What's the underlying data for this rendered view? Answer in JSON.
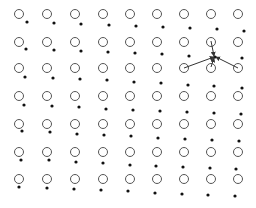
{
  "diagram": {
    "colors": {
      "circle_stroke": "#555555",
      "dot_fill": "#111111",
      "arrow": "#333333",
      "background": "#ffffff"
    },
    "circle_radius": 4.5,
    "dot_radius": 1.6,
    "grid": {
      "cols_x": [
        19,
        47,
        75,
        103,
        130,
        157,
        184,
        211,
        238
      ],
      "rows_y": [
        14,
        42,
        68,
        96,
        124,
        152,
        179
      ]
    },
    "dots": [
      [
        27,
        22
      ],
      [
        54,
        23
      ],
      [
        81,
        24
      ],
      [
        109,
        25
      ],
      [
        136,
        26
      ],
      [
        163,
        27
      ],
      [
        190,
        28
      ],
      [
        217,
        29
      ],
      [
        244,
        31
      ],
      [
        26,
        49
      ],
      [
        54,
        50
      ],
      [
        81,
        51
      ],
      [
        108,
        52
      ],
      [
        135,
        53
      ],
      [
        162,
        54
      ],
      [
        189,
        56
      ],
      [
        215,
        57
      ],
      [
        242,
        58
      ],
      [
        25,
        77
      ],
      [
        53,
        78
      ],
      [
        80,
        79
      ],
      [
        107,
        80
      ],
      [
        134,
        82
      ],
      [
        161,
        83
      ],
      [
        188,
        85
      ],
      [
        214,
        86
      ],
      [
        242,
        88
      ],
      [
        24,
        105
      ],
      [
        52,
        106
      ],
      [
        79,
        107
      ],
      [
        106,
        109
      ],
      [
        133,
        110
      ],
      [
        160,
        111
      ],
      [
        187,
        112
      ],
      [
        214,
        113
      ],
      [
        241,
        114
      ],
      [
        22,
        131
      ],
      [
        50,
        132
      ],
      [
        77,
        134
      ],
      [
        104,
        135
      ],
      [
        131,
        136
      ],
      [
        158,
        138
      ],
      [
        185,
        139
      ],
      [
        212,
        140
      ],
      [
        239,
        141
      ],
      [
        21,
        160
      ],
      [
        49,
        160
      ],
      [
        76,
        162
      ],
      [
        103,
        163
      ],
      [
        130,
        165
      ],
      [
        156,
        166
      ],
      [
        183,
        167
      ],
      [
        210,
        168
      ],
      [
        236,
        169
      ],
      [
        19,
        187
      ],
      [
        47,
        188
      ],
      [
        74,
        189
      ],
      [
        101,
        190
      ],
      [
        128,
        191
      ],
      [
        155,
        193
      ],
      [
        182,
        194
      ],
      [
        208,
        195
      ],
      [
        235,
        196
      ]
    ],
    "arrows": [
      {
        "from": [
          184,
          68
        ],
        "to": [
          214,
          57
        ]
      },
      {
        "from": [
          211,
          41
        ],
        "to": [
          214,
          56
        ]
      },
      {
        "from": [
          211,
          67
        ],
        "to": [
          214,
          58
        ]
      },
      {
        "from": [
          238,
          68
        ],
        "to": [
          216,
          57
        ]
      }
    ]
  }
}
